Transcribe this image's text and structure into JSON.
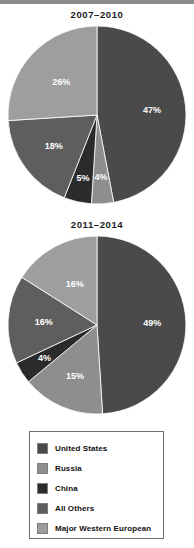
{
  "legend": {
    "name": "series-legend",
    "items": [
      {
        "label": "United States",
        "color": "#4a4a4a"
      },
      {
        "label": "Russia",
        "color": "#8e8e8e"
      },
      {
        "label": "China",
        "color": "#2b2b2b"
      },
      {
        "label": "All Others",
        "color": "#5e5e5e"
      },
      {
        "label": "Major Western European",
        "color": "#9e9e9e"
      }
    ]
  },
  "chart_data": [
    {
      "type": "pie",
      "title": "2007–2010",
      "xlabel": "",
      "ylabel": "",
      "legend_position": "bottom",
      "grid": false,
      "categories": [
        "United States",
        "Russia",
        "China",
        "All Others",
        "Major Western European"
      ],
      "values": [
        47,
        4,
        5,
        18,
        26
      ],
      "labels": [
        "47%",
        "4%",
        "5%",
        "18%",
        "26%"
      ],
      "colors": [
        "#4a4a4a",
        "#8e8e8e",
        "#2b2b2b",
        "#5e5e5e",
        "#9e9e9e"
      ]
    },
    {
      "type": "pie",
      "title": "2011–2014",
      "xlabel": "",
      "ylabel": "",
      "legend_position": "bottom",
      "grid": false,
      "categories": [
        "United States",
        "Russia",
        "China",
        "All Others",
        "Major Western European"
      ],
      "values": [
        49,
        15,
        4,
        16,
        16
      ],
      "labels": [
        "49%",
        "15%",
        "4%",
        "16%",
        "16%"
      ],
      "colors": [
        "#4a4a4a",
        "#8e8e8e",
        "#2b2b2b",
        "#5e5e5e",
        "#9e9e9e"
      ]
    }
  ]
}
